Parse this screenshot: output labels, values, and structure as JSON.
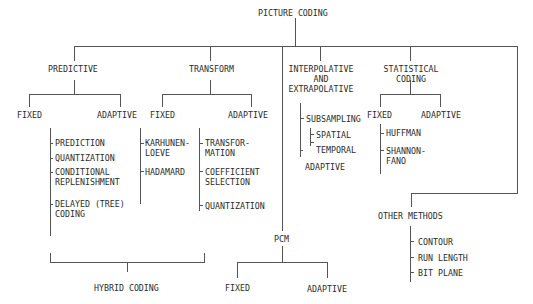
{
  "diagram": {
    "root": "PICTURE CODING",
    "predictive": {
      "label": "PREDICTIVE",
      "fixed": "FIXED",
      "adaptive": "ADAPTIVE",
      "adaptive_items": [
        "PREDICTION",
        "QUANTIZATION",
        "CONDITIONAL\nREPLENISHMENT",
        "DELAYED (TREE)\nCODING"
      ]
    },
    "transform": {
      "label": "TRANSFORM",
      "fixed": "FIXED",
      "adaptive": "ADAPTIVE",
      "fixed_items": [
        "KARHUNEN-\nLOEVE",
        "HADAMARD"
      ],
      "adaptive_items": [
        "TRANSFOR-\nMATION",
        "COEFFICIENT\nSELECTION",
        "QUANTIZATION"
      ]
    },
    "interpolative": {
      "label": "INTERPOLATIVE\nAND\nEXTRAPOLATIVE",
      "items": [
        "SUBSAMPLING",
        "ADAPTIVE"
      ],
      "subsampling_items": [
        "SPATIAL",
        "TEMPORAL"
      ]
    },
    "statistical": {
      "label": "STATISTICAL\nCODING",
      "fixed": "FIXED",
      "adaptive": "ADAPTIVE",
      "fixed_items": [
        "HUFFMAN",
        "SHANNON-\nFANO"
      ]
    },
    "pcm": {
      "label": "PCM",
      "fixed": "FIXED",
      "adaptive": "ADAPTIVE"
    },
    "other": {
      "label": "OTHER METHODS",
      "items": [
        "CONTOUR",
        "RUN LENGTH",
        "BIT PLANE"
      ]
    },
    "hybrid": "HYBRID CODING",
    "colors": {
      "line": "#555555",
      "text": "#2b2b2b",
      "background": "#ffffff"
    }
  }
}
